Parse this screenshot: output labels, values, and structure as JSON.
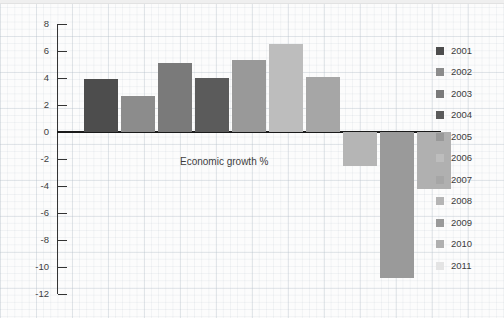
{
  "chart_data": {
    "type": "bar",
    "title": "",
    "subtitle": "",
    "annotation": "Economic growth %",
    "xlabel": "",
    "ylabel": "",
    "ylim": [
      -12,
      8
    ],
    "y_ticks": [
      8,
      6,
      4,
      2,
      0,
      -2,
      -4,
      -6,
      -8,
      -10,
      -12
    ],
    "y_tick_labels": [
      "8",
      "6",
      "4",
      "2",
      "0",
      "-2",
      "-4",
      "-6",
      "-8",
      "-10",
      "-12"
    ],
    "grid": true,
    "legend_position": "right",
    "categories": [
      "2001",
      "2002",
      "2003",
      "2004",
      "2005",
      "2006",
      "2007",
      "2008",
      "2009",
      "2010",
      "2011"
    ],
    "values": [
      3.9,
      2.7,
      5.1,
      4.0,
      5.3,
      6.5,
      4.1,
      -2.5,
      -10.8,
      -4.2,
      0
    ],
    "colors": [
      "#4d4d4d",
      "#8c8c8c",
      "#7a7a7a",
      "#5b5b5b",
      "#999999",
      "#bdbdbd",
      "#a6a6a6",
      "#b5b5b5",
      "#9a9a9a",
      "#b0b0b0",
      "#e4e4e4"
    ],
    "series": [
      {
        "name": "Economic growth %",
        "values": [
          3.9,
          2.7,
          5.1,
          4.0,
          5.3,
          6.5,
          4.1,
          -2.5,
          -10.8,
          -4.2,
          0
        ]
      }
    ]
  },
  "legend": {
    "items": [
      {
        "label": "2001",
        "color": "#4d4d4d"
      },
      {
        "label": "2002",
        "color": "#8c8c8c"
      },
      {
        "label": "2003",
        "color": "#7a7a7a"
      },
      {
        "label": "2004",
        "color": "#5b5b5b"
      },
      {
        "label": "2005",
        "color": "#999999"
      },
      {
        "label": "2006",
        "color": "#bdbdbd"
      },
      {
        "label": "2007",
        "color": "#a6a6a6"
      },
      {
        "label": "2008",
        "color": "#b5b5b5"
      },
      {
        "label": "2009",
        "color": "#9a9a9a"
      },
      {
        "label": "2010",
        "color": "#b0b0b0"
      },
      {
        "label": "2011",
        "color": "#e4e4e4"
      }
    ]
  },
  "axis": {
    "zero_label": "0",
    "annotation": "Economic growth %"
  }
}
